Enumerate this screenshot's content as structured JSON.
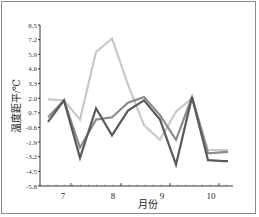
{
  "chart_data": {
    "type": "line",
    "title": "",
    "xlabel": "月份",
    "ylabel": "温度距平/℃",
    "ylim": [
      -5.8,
      8.5
    ],
    "yticks": [
      8.5,
      7.2,
      5.9,
      4.6,
      3.3,
      2.0,
      0.7,
      -0.6,
      -1.9,
      -3.2,
      -4.5,
      -5.8
    ],
    "xtick_labels": [
      "7",
      "8",
      "9",
      "10"
    ],
    "x": [
      1,
      2,
      3,
      4,
      5,
      6,
      7,
      8,
      9,
      10,
      11,
      12
    ],
    "grid": false,
    "legend": null,
    "series": [
      {
        "name": "series-light",
        "color": "#c8c8c8",
        "values": [
          1.9,
          1.8,
          0.1,
          6.1,
          7.3,
          3.2,
          -0.4,
          -1.7,
          0.8,
          2.0,
          -2.6,
          -2.6
        ]
      },
      {
        "name": "series-mid",
        "color": "#8c8c8c",
        "values": [
          0.3,
          1.8,
          -2.4,
          0.1,
          0.3,
          1.6,
          2.1,
          0.5,
          -1.7,
          2.1,
          -2.9,
          -2.8
        ]
      },
      {
        "name": "series-dark",
        "color": "#5a5a5a",
        "values": [
          -0.1,
          1.8,
          -3.3,
          1.1,
          -1.3,
          0.9,
          1.8,
          0.1,
          -3.9,
          2.1,
          -3.5,
          -3.6
        ]
      }
    ]
  }
}
